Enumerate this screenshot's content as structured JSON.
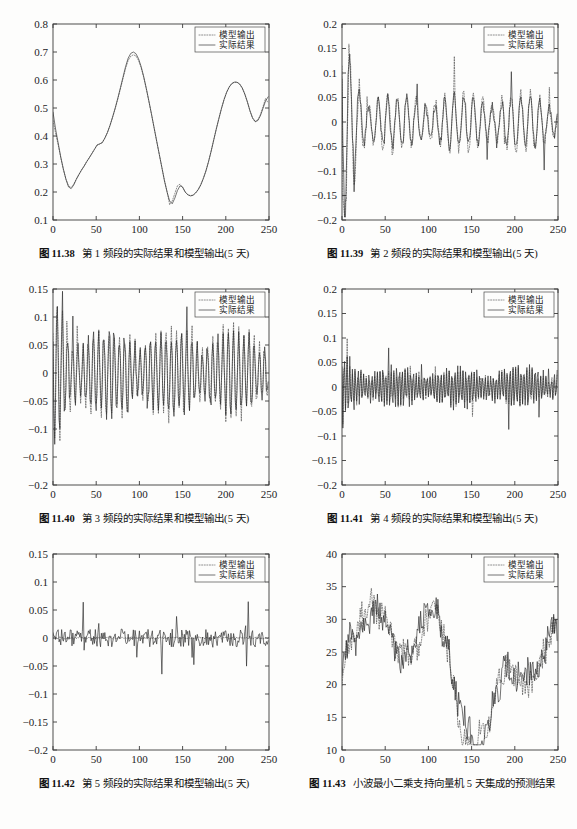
{
  "page": {
    "background": "#fdfdfc",
    "ink": "#1a1a1a"
  },
  "legend": {
    "model_label": "模型输出",
    "actual_label": "实际结果",
    "model_style": "dotted",
    "actual_style": "solid"
  },
  "figures": [
    {
      "id": "fig-11-38",
      "number": "图 11.38",
      "caption": "第 1 频段的实际结果和模型输出(5 天)",
      "chart_data": {
        "type": "line",
        "title": "",
        "xlabel": "",
        "ylabel": "",
        "xlim": [
          0,
          250
        ],
        "ylim": [
          0.1,
          0.8
        ],
        "xticks": [
          0,
          50,
          100,
          150,
          200,
          250
        ],
        "yticks": [
          0.1,
          0.2,
          0.3,
          0.4,
          0.5,
          0.6,
          0.7,
          0.8
        ],
        "ytick_labels": [
          "0.1",
          "0.2",
          "0.3",
          "0.4",
          "0.5",
          "0.6",
          "0.7",
          "0.8"
        ],
        "xtick_labels": [
          "0",
          "50",
          "100",
          "150",
          "200",
          "250"
        ],
        "grid": false,
        "legend_position": "top-right",
        "series": [
          {
            "name": "实际结果",
            "style": "solid",
            "x": [
              0,
              3,
              6,
              9,
              12,
              15,
              18,
              21,
              24,
              27,
              30,
              33,
              36,
              39,
              42,
              45,
              48,
              51,
              54,
              57,
              60,
              63,
              66,
              69,
              72,
              75,
              78,
              81,
              84,
              87,
              90,
              93,
              96,
              99,
              102,
              105,
              108,
              111,
              114,
              117,
              120,
              123,
              126,
              129,
              132,
              135,
              138,
              141,
              144,
              147,
              150,
              153,
              156,
              159,
              162,
              165,
              168,
              171,
              174,
              177,
              180,
              183,
              186,
              189,
              192,
              195,
              198,
              201,
              204,
              207,
              210,
              213,
              216,
              219,
              222,
              225,
              228,
              231,
              234,
              237,
              240,
              243,
              246,
              249
            ],
            "values": [
              0.485,
              0.425,
              0.375,
              0.325,
              0.282,
              0.245,
              0.218,
              0.212,
              0.225,
              0.245,
              0.262,
              0.278,
              0.292,
              0.308,
              0.322,
              0.337,
              0.352,
              0.368,
              0.372,
              0.376,
              0.392,
              0.412,
              0.438,
              0.468,
              0.5,
              0.535,
              0.572,
              0.61,
              0.648,
              0.678,
              0.695,
              0.7,
              0.694,
              0.676,
              0.648,
              0.612,
              0.57,
              0.525,
              0.478,
              0.43,
              0.382,
              0.335,
              0.288,
              0.24,
              0.2,
              0.168,
              0.158,
              0.178,
              0.205,
              0.222,
              0.218,
              0.2,
              0.19,
              0.186,
              0.188,
              0.196,
              0.208,
              0.225,
              0.248,
              0.275,
              0.308,
              0.345,
              0.385,
              0.425,
              0.462,
              0.498,
              0.53,
              0.556,
              0.575,
              0.587,
              0.592,
              0.592,
              0.586,
              0.572,
              0.55,
              0.522,
              0.49,
              0.465,
              0.452,
              0.455,
              0.472,
              0.498,
              0.525,
              0.54
            ]
          },
          {
            "name": "模型输出",
            "style": "dotted",
            "x": [
              0,
              3,
              6,
              9,
              12,
              15,
              18,
              21,
              24,
              27,
              30,
              33,
              36,
              39,
              42,
              45,
              48,
              51,
              54,
              57,
              60,
              63,
              66,
              69,
              72,
              75,
              78,
              81,
              84,
              87,
              90,
              93,
              96,
              99,
              102,
              105,
              108,
              111,
              114,
              117,
              120,
              123,
              126,
              129,
              132,
              135,
              138,
              141,
              144,
              147,
              150,
              153,
              156,
              159,
              162,
              165,
              168,
              171,
              174,
              177,
              180,
              183,
              186,
              189,
              192,
              195,
              198,
              201,
              204,
              207,
              210,
              213,
              216,
              219,
              222,
              225,
              228,
              231,
              234,
              237,
              240,
              243,
              246,
              249
            ],
            "values": [
              0.455,
              0.41,
              0.368,
              0.322,
              0.28,
              0.246,
              0.222,
              0.216,
              0.228,
              0.247,
              0.263,
              0.279,
              0.293,
              0.309,
              0.323,
              0.338,
              0.353,
              0.367,
              0.371,
              0.377,
              0.393,
              0.413,
              0.438,
              0.467,
              0.498,
              0.532,
              0.568,
              0.605,
              0.641,
              0.67,
              0.685,
              0.69,
              0.686,
              0.67,
              0.644,
              0.609,
              0.568,
              0.523,
              0.477,
              0.429,
              0.381,
              0.334,
              0.287,
              0.241,
              0.202,
              0.155,
              0.168,
              0.195,
              0.222,
              0.228,
              0.216,
              0.2,
              0.191,
              0.187,
              0.189,
              0.197,
              0.209,
              0.226,
              0.249,
              0.276,
              0.309,
              0.346,
              0.386,
              0.426,
              0.463,
              0.499,
              0.531,
              0.557,
              0.576,
              0.588,
              0.593,
              0.592,
              0.585,
              0.571,
              0.549,
              0.521,
              0.489,
              0.463,
              0.45,
              0.457,
              0.476,
              0.504,
              0.534,
              0.518
            ]
          }
        ]
      }
    },
    {
      "id": "fig-11-39",
      "number": "图 11.39",
      "caption": "第 2 频段的实际结果和模型输出(5 天)",
      "chart_data": {
        "type": "line",
        "title": "",
        "xlabel": "",
        "ylabel": "",
        "xlim": [
          0,
          250
        ],
        "ylim": [
          -0.2,
          0.2
        ],
        "xticks": [
          0,
          50,
          100,
          150,
          200,
          250
        ],
        "yticks": [
          -0.2,
          -0.15,
          -0.1,
          -0.05,
          0,
          0.05,
          0.1,
          0.15,
          0.2
        ],
        "ytick_labels": [
          "−0.2",
          "−0.15",
          "−0.1",
          "−0.05",
          "0",
          "0.05",
          "0.1",
          "0.15",
          "0.2"
        ],
        "xtick_labels": [
          "0",
          "50",
          "100",
          "150",
          "200",
          "250"
        ],
        "grid": false,
        "legend_position": "top-right",
        "series": [
          {
            "name": "实际结果",
            "style": "solid",
            "seed": 11.39,
            "kind": "oscillatory",
            "amplitude": 0.045,
            "decay_start": 0.17,
            "period": 11
          },
          {
            "name": "模型输出",
            "style": "dotted",
            "seed": 11.391,
            "kind": "oscillatory",
            "amplitude": 0.05,
            "decay_start": 0.2,
            "period": 11
          }
        ]
      }
    },
    {
      "id": "fig-11-40",
      "number": "图 11.40",
      "caption": "第 3 频段的实际结果和模型输出(5 天)",
      "chart_data": {
        "type": "line",
        "title": "",
        "xlabel": "",
        "ylabel": "",
        "xlim": [
          0,
          250
        ],
        "ylim": [
          -0.2,
          0.15
        ],
        "xticks": [
          0,
          50,
          100,
          150,
          200,
          250
        ],
        "yticks": [
          -0.2,
          -0.15,
          -0.1,
          -0.05,
          0,
          0.05,
          0.1,
          0.15
        ],
        "ytick_labels": [
          "−0.2",
          "−0.15",
          "−0.1",
          "−0.05",
          "0",
          "0.05",
          "0.1",
          "0.15"
        ],
        "xtick_labels": [
          "0",
          "50",
          "100",
          "150",
          "200",
          "250"
        ],
        "grid": false,
        "legend_position": "top-right",
        "series": [
          {
            "name": "实际结果",
            "style": "solid",
            "seed": 11.4,
            "kind": "oscillatory",
            "amplitude": 0.062,
            "decay_start": 0.062,
            "period": 6
          },
          {
            "name": "模型输出",
            "style": "dotted",
            "seed": 11.401,
            "kind": "oscillatory",
            "amplitude": 0.066,
            "decay_start": 0.066,
            "period": 6
          }
        ]
      }
    },
    {
      "id": "fig-11-41",
      "number": "图 11.41",
      "caption": "第 4 频段的实际结果和模型输出(5 天)",
      "chart_data": {
        "type": "line",
        "title": "",
        "xlabel": "",
        "ylabel": "",
        "xlim": [
          0,
          250
        ],
        "ylim": [
          -0.2,
          0.2
        ],
        "xticks": [
          0,
          50,
          100,
          150,
          200,
          250
        ],
        "yticks": [
          -0.2,
          -0.15,
          -0.1,
          -0.05,
          0,
          0.05,
          0.1,
          0.15,
          0.2
        ],
        "ytick_labels": [
          "−0.2",
          "−0.15",
          "−0.1",
          "−0.05",
          "0",
          "0.05",
          "0.1",
          "0.15",
          "0.2"
        ],
        "xtick_labels": [
          "0",
          "50",
          "100",
          "150",
          "200",
          "250"
        ],
        "grid": false,
        "legend_position": "top-right",
        "series": [
          {
            "name": "实际结果",
            "style": "solid",
            "seed": 11.41,
            "kind": "oscillatory",
            "amplitude": 0.035,
            "decay_start": 0.035,
            "period": 3.2
          },
          {
            "name": "模型输出",
            "style": "dotted",
            "seed": 11.411,
            "kind": "oscillatory",
            "amplitude": 0.03,
            "decay_start": 0.03,
            "period": 3.2
          }
        ]
      }
    },
    {
      "id": "fig-11-42",
      "number": "图 11.42",
      "caption": "第 5 频段的实际结果和模型输出(5 天)",
      "chart_data": {
        "type": "line",
        "title": "",
        "xlabel": "",
        "ylabel": "",
        "xlim": [
          0,
          250
        ],
        "ylim": [
          -0.2,
          0.15
        ],
        "xticks": [
          0,
          50,
          100,
          150,
          200,
          250
        ],
        "yticks": [
          -0.2,
          -0.15,
          -0.1,
          -0.05,
          0,
          0.05,
          0.1,
          0.15
        ],
        "ytick_labels": [
          "−0.2",
          "−0.15",
          "−0.1",
          "−0.05",
          "0",
          "0.05",
          "0.1",
          "0.15"
        ],
        "xtick_labels": [
          "0",
          "50",
          "100",
          "150",
          "200",
          "250"
        ],
        "grid": false,
        "legend_position": "top-right",
        "series": [
          {
            "name": "实际结果",
            "style": "solid",
            "seed": 11.42,
            "kind": "noise",
            "amplitude": 0.016,
            "decay_start": 0.016,
            "period": 1.6
          },
          {
            "name": "模型输出",
            "style": "dotted",
            "seed": 11.421,
            "kind": "flat",
            "amplitude": 0.002,
            "decay_start": 0.002,
            "period": 1.6
          }
        ]
      }
    },
    {
      "id": "fig-11-43",
      "number": "图 11.43",
      "caption": "小波最小二乘支持向量机 5 天集成的预测结果",
      "chart_data": {
        "type": "line",
        "title": "",
        "xlabel": "",
        "ylabel": "",
        "xlim": [
          0,
          250
        ],
        "ylim": [
          10,
          40
        ],
        "xticks": [
          0,
          50,
          100,
          150,
          200,
          250
        ],
        "yticks": [
          10,
          15,
          20,
          25,
          30,
          35,
          40
        ],
        "ytick_labels": [
          "10",
          "15",
          "20",
          "25",
          "30",
          "35",
          "40"
        ],
        "xtick_labels": [
          "0",
          "50",
          "100",
          "150",
          "200",
          "250"
        ],
        "grid": false,
        "legend_position": "top-right",
        "series": [
          {
            "name": "实际结果",
            "style": "solid",
            "seed": 11.43,
            "kind": "price",
            "amplitude": 2.6,
            "decay_start": 2.6,
            "period": 7
          },
          {
            "name": "模型输出",
            "style": "dotted",
            "seed": 11.4305,
            "kind": "price",
            "amplitude": 2.45,
            "decay_start": 2.45,
            "period": 7
          }
        ]
      }
    }
  ]
}
